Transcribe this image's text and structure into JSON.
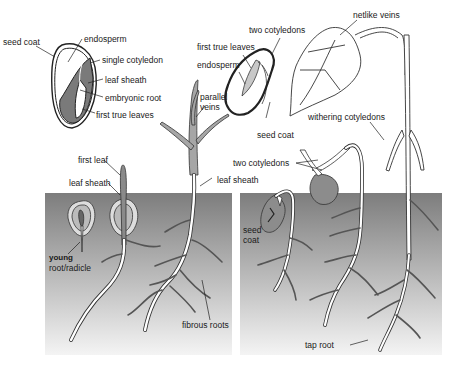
{
  "diagram": {
    "colors": {
      "soil_top": "#7d7d7d",
      "soil_bottom": "#f2f2f2",
      "plant_fill": "#a6a6a6",
      "cotyledon_dark": "#6e6e6e",
      "root_fill": "#ffffff",
      "outline": "#222222"
    },
    "monocot_seed_labels": {
      "seed_coat": "seed coat",
      "endosperm": "endosperm",
      "single_cotyledon": "single cotyledon",
      "leaf_sheath": "leaf sheath",
      "embryonic_root": "embryonic root",
      "first_true_leaves": "first true leaves"
    },
    "dicot_seed_labels": {
      "two_cotyledons": "two cotyledons",
      "first_true_leaves": "first true leaves",
      "endosperm": "endosperm",
      "seed_coat": "seed coat"
    },
    "monocot_seedling_labels": {
      "first_leaf": "first leaf",
      "leaf_sheath": "leaf sheath",
      "young_root_line1": "young",
      "young_root_line2": "root/radicle",
      "parallel_veins_line1": "parallel",
      "parallel_veins_line2": "veins",
      "leaf_sheath_2": "leaf sheath",
      "fibrous_roots": "fibrous roots"
    },
    "dicot_seedling_labels": {
      "netlike_veins": "netlike veins",
      "withering_cotyledons": "withering cotyledons",
      "two_cotyledons": "two cotyledons",
      "seed_coat_line1": "seed",
      "seed_coat_line2": "coat",
      "tap_root": "tap root"
    }
  }
}
